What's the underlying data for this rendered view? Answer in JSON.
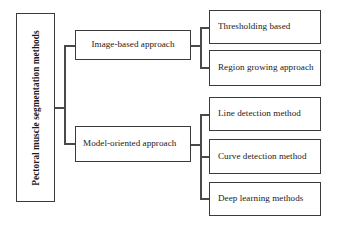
{
  "diagram": {
    "type": "horizontal-tree-flowchart",
    "border_color": "#3b3b3b",
    "connector_color": "#4a4a4a",
    "background_color": "#ffffff"
  },
  "root": {
    "label": "Pectoral muscle segmentation methods",
    "orientation": "vertical-rotated",
    "bold": true
  },
  "branches": [
    {
      "id": "image-based",
      "label": "Image-based approach",
      "children": [
        {
          "id": "thresholding",
          "label": "Thresholding based"
        },
        {
          "id": "region-growing",
          "label": "Region growing approach"
        }
      ]
    },
    {
      "id": "model-oriented",
      "label": "Model-oriented approach",
      "children": [
        {
          "id": "line-detection",
          "label": "Line detection method"
        },
        {
          "id": "curve-detection",
          "label": "Curve detection method"
        },
        {
          "id": "deep-learning",
          "label": "Deep learning methods"
        }
      ]
    }
  ]
}
